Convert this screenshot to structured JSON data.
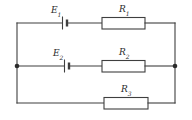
{
  "figure": {
    "background_color": "#ffffff",
    "line_color": "#3f3f3f",
    "text_color": "#2b2b2b"
  },
  "labels": {
    "e1": "E",
    "e1_sub": "1",
    "e2": "E",
    "e2_sub": "2",
    "r1": "R",
    "r1_sub": "1",
    "r2": "R",
    "r2_sub": "2",
    "r3": "R",
    "r3_sub": "3"
  },
  "components": [
    {
      "name": "battery-e1",
      "type": "battery",
      "label": "E1",
      "branch": "top"
    },
    {
      "name": "resistor-r1",
      "type": "resistor",
      "label": "R1",
      "branch": "top"
    },
    {
      "name": "battery-e2",
      "type": "battery",
      "label": "E2",
      "branch": "middle"
    },
    {
      "name": "resistor-r2",
      "type": "resistor",
      "label": "R2",
      "branch": "middle"
    },
    {
      "name": "resistor-r3",
      "type": "resistor",
      "label": "R3",
      "branch": "bottom"
    }
  ],
  "nodes": [
    {
      "name": "left-junction",
      "x": 17,
      "y": 66
    },
    {
      "name": "right-junction",
      "x": 175,
      "y": 66
    }
  ],
  "branches": [
    {
      "name": "top-branch",
      "y": 23,
      "contents": [
        "E1",
        "R1"
      ]
    },
    {
      "name": "middle-branch",
      "y": 66,
      "contents": [
        "E2",
        "R2"
      ]
    },
    {
      "name": "bottom-branch",
      "y": 103,
      "contents": [
        "R3"
      ]
    }
  ]
}
